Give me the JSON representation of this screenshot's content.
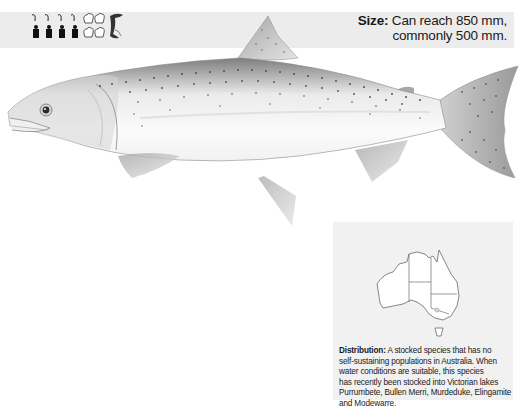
{
  "header": {
    "rating_icons": {
      "angling": {
        "icon": "angler-icon",
        "count": 4
      },
      "eating": {
        "icon": "chef-hat-icon",
        "count": 4
      },
      "species": {
        "icon": "fish-leaping-icon",
        "count": 1
      }
    },
    "size": {
      "label": "Size:",
      "line1": "Can reach 850 mm,",
      "line2": "commonly 500 mm."
    }
  },
  "illustration": {
    "subject": "trout-illustration",
    "colors": {
      "body": "#f4f4f4",
      "back": "#8a8a8a",
      "spots": "#4a4a4a",
      "fins": "#9c9c9c"
    }
  },
  "distribution": {
    "map": "australia-outline-map",
    "label": "Distribution:",
    "text": "A stocked species that has no self-sustaining populations in Australia. When water conditions are suitable, this species has recently been stocked into Victorian lakes Purrumbete, Bullen Merri, Murdeduke, Elingamite and Modewarre.",
    "lines": [
      "A stocked species that has no",
      "self-sustaining populations in Australia. When",
      "water conditions are suitable, this species",
      "has recently been stocked into Victorian lakes",
      "Purrumbete, Bullen Merri, Murdeduke, Elingamite",
      "and Modewarre."
    ]
  },
  "colors": {
    "band": "#ececec",
    "panel": "#f1f1f1",
    "text": "#1a1a1a"
  }
}
